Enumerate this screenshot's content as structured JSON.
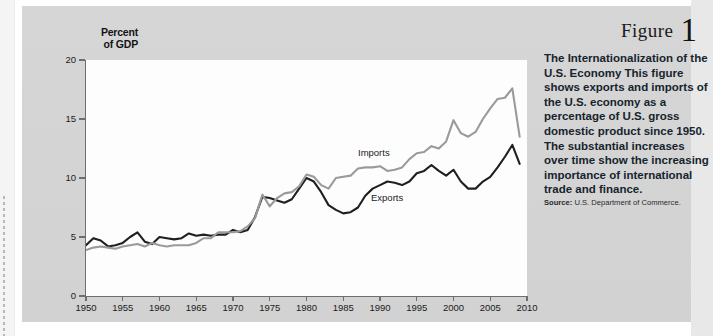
{
  "figure": {
    "label": "Figure",
    "number": "1",
    "title": "The Internationalization of the U.S. Economy",
    "description": "This figure shows exports and imports of the U.S. economy as a percentage of U.S. gross domestic product since 1950. The substantial increases over time show the increasing importance of international trade and finance.",
    "source_label": "Source:",
    "source_text": "U.S. Department of Commerce."
  },
  "colors": {
    "panel_background": "#d4d4d4",
    "plot_background": "#fdfdfd",
    "axis": "#6e6e6e",
    "imports_line": "#9a9a9a",
    "exports_line": "#1f1f1f",
    "caption_text": "#16242e"
  },
  "chart_data": {
    "type": "line",
    "title": "The Internationalization of the U.S. Economy",
    "xlabel": "",
    "ylabel": "Percent of GDP",
    "ylabel_line1": "Percent",
    "ylabel_line2": "of GDP",
    "xlim": [
      1950,
      2010
    ],
    "ylim": [
      0,
      20
    ],
    "yticks": [
      0,
      5,
      10,
      15,
      20
    ],
    "xticks": [
      1950,
      1955,
      1960,
      1965,
      1970,
      1975,
      1980,
      1985,
      1990,
      1995,
      2000,
      2005,
      2010
    ],
    "grid": false,
    "legend": "inline-annotations",
    "annotations": [
      {
        "text": "Imports",
        "x": 1988,
        "y": 11.6
      },
      {
        "text": "Exports",
        "x": 1990,
        "y": 8.2
      }
    ],
    "x": [
      1950,
      1951,
      1952,
      1953,
      1954,
      1955,
      1956,
      1957,
      1958,
      1959,
      1960,
      1961,
      1962,
      1963,
      1964,
      1965,
      1966,
      1967,
      1968,
      1969,
      1970,
      1971,
      1972,
      1973,
      1974,
      1975,
      1976,
      1977,
      1978,
      1979,
      1980,
      1981,
      1982,
      1983,
      1984,
      1985,
      1986,
      1987,
      1988,
      1989,
      1990,
      1991,
      1992,
      1993,
      1994,
      1995,
      1996,
      1997,
      1998,
      1999,
      2000,
      2001,
      2002,
      2003,
      2004,
      2005,
      2006,
      2007,
      2008,
      2009
    ],
    "series": [
      {
        "name": "Exports",
        "color": "#1f1f1f",
        "values": [
          4.3,
          4.9,
          4.7,
          4.2,
          4.3,
          4.5,
          5.0,
          5.4,
          4.6,
          4.4,
          5.0,
          4.9,
          4.8,
          4.9,
          5.3,
          5.1,
          5.2,
          5.1,
          5.2,
          5.2,
          5.6,
          5.4,
          5.6,
          6.7,
          8.4,
          8.3,
          8.1,
          7.9,
          8.2,
          9.1,
          10.0,
          9.7,
          8.8,
          7.7,
          7.3,
          7.0,
          7.1,
          7.5,
          8.5,
          9.1,
          9.4,
          9.7,
          9.6,
          9.4,
          9.7,
          10.4,
          10.6,
          11.1,
          10.6,
          10.2,
          10.7,
          9.7,
          9.1,
          9.1,
          9.7,
          10.1,
          10.9,
          11.8,
          12.8,
          11.2
        ]
      },
      {
        "name": "Imports",
        "color": "#9a9a9a",
        "values": [
          3.9,
          4.1,
          4.2,
          4.1,
          4.0,
          4.2,
          4.3,
          4.4,
          4.2,
          4.5,
          4.3,
          4.2,
          4.3,
          4.3,
          4.3,
          4.5,
          4.9,
          4.9,
          5.4,
          5.4,
          5.4,
          5.5,
          5.9,
          6.6,
          8.6,
          7.6,
          8.3,
          8.7,
          8.8,
          9.3,
          10.3,
          10.1,
          9.4,
          9.1,
          10.0,
          10.1,
          10.2,
          10.8,
          10.9,
          10.9,
          11.0,
          10.6,
          10.7,
          10.9,
          11.6,
          12.1,
          12.2,
          12.7,
          12.5,
          13.1,
          14.9,
          13.8,
          13.5,
          13.9,
          15.0,
          15.9,
          16.7,
          16.8,
          17.6,
          13.5
        ]
      }
    ]
  }
}
